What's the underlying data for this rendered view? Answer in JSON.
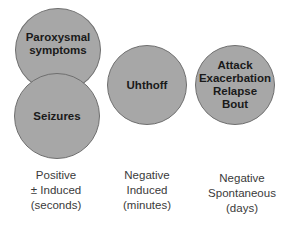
{
  "diagram": {
    "circles": [
      {
        "id": "paroxysmal",
        "text": "Paroxysmal\nsymptoms",
        "fill": "#a7a7a7"
      },
      {
        "id": "seizures",
        "text": "Seizures",
        "fill": "#a7a7a7"
      },
      {
        "id": "uhthoff",
        "text": "Uhthoff",
        "fill": "#a7a7a7"
      },
      {
        "id": "attack",
        "text": "Attack\nExacerbation\nRelapse\nBout",
        "fill": "#a7a7a7"
      }
    ],
    "labels": [
      {
        "text": "Positive\n± Induced\n(seconds)"
      },
      {
        "text": "Negative\nInduced\n(minutes)"
      },
      {
        "text": "Negative\nSpontaneous\n(days)"
      }
    ]
  }
}
